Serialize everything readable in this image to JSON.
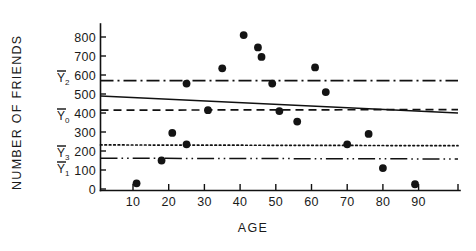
{
  "chart_data": {
    "type": "scatter",
    "title": "",
    "xlabel": "AGE",
    "ylabel": "NUMBER OF FRIENDS",
    "xlim": [
      0,
      95
    ],
    "ylim": [
      0,
      870
    ],
    "grid": false,
    "legend_position": "left-axis-annotations",
    "xticks": [
      10,
      20,
      30,
      40,
      50,
      60,
      70,
      80,
      90
    ],
    "xtick_labels": [
      "10",
      "20",
      "30",
      "40",
      "50",
      "60",
      "70",
      "80",
      "90"
    ],
    "yticks": [
      0,
      100,
      200,
      300,
      400,
      500,
      600,
      700,
      800
    ],
    "ytick_labels": [
      "0",
      "100",
      "200",
      "300",
      "400",
      "500",
      "600",
      "700",
      "800"
    ],
    "points": [
      {
        "x": 11,
        "y": 30
      },
      {
        "x": 18,
        "y": 150
      },
      {
        "x": 21,
        "y": 295
      },
      {
        "x": 25,
        "y": 235
      },
      {
        "x": 25,
        "y": 555
      },
      {
        "x": 31,
        "y": 415
      },
      {
        "x": 35,
        "y": 635
      },
      {
        "x": 41,
        "y": 810
      },
      {
        "x": 45,
        "y": 745
      },
      {
        "x": 46,
        "y": 695
      },
      {
        "x": 49,
        "y": 555
      },
      {
        "x": 51,
        "y": 410
      },
      {
        "x": 56,
        "y": 355
      },
      {
        "x": 61,
        "y": 640
      },
      {
        "x": 64,
        "y": 510
      },
      {
        "x": 70,
        "y": 235
      },
      {
        "x": 76,
        "y": 290
      },
      {
        "x": 80,
        "y": 110
      },
      {
        "x": 89,
        "y": 25
      }
    ],
    "reference_lines": [
      {
        "name": "regression",
        "style": "solid",
        "label": "",
        "sub": "",
        "y_start": 490,
        "y_end": 400
      },
      {
        "name": "Y2-mean",
        "style": "dash-dot",
        "label": "Y",
        "sub": "2",
        "y_start": 570,
        "y_end": 570
      },
      {
        "name": "Y0-mean",
        "style": "dashed",
        "label": "Y",
        "sub": "0",
        "y_start": 415,
        "y_end": 418
      },
      {
        "name": "Y3-mean",
        "style": "dotted",
        "label": "Y",
        "sub": "3",
        "y_start": 232,
        "y_end": 228
      },
      {
        "name": "Y1-mean",
        "style": "dash-dot-dot",
        "label": "Y",
        "sub": "1",
        "y_start": 162,
        "y_end": 158
      }
    ],
    "mean_labels": [
      {
        "label": "Y",
        "sub": "2",
        "value": 570
      },
      {
        "label": "Y",
        "sub": "0",
        "value": 415
      },
      {
        "label": "Y",
        "sub": "3",
        "value": 232
      },
      {
        "label": "Y",
        "sub": "1",
        "value": 162
      }
    ],
    "colors": {
      "axis": "#111111",
      "point": "#141414",
      "background": "#ffffff"
    }
  }
}
